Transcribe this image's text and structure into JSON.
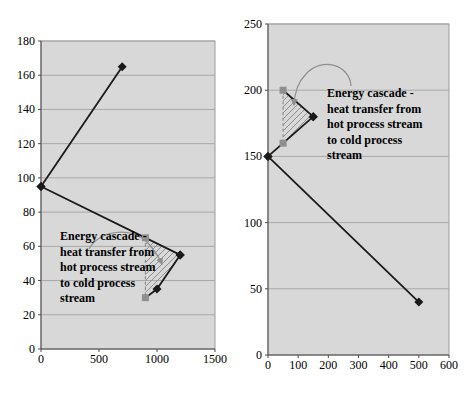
{
  "figure": {
    "background": "#ffffff"
  },
  "colors": {
    "plot_bg": "#d8d8d8",
    "plot_border": "#9c9c9c",
    "gridline": "#a9a9a9",
    "axis": "#4d4d4d",
    "series_black": "#1a1a1a",
    "cascade_gray": "#8f8f8f",
    "text": "#000000"
  },
  "chart_data": [
    {
      "type": "line",
      "title": "",
      "xlabel": "",
      "ylabel": "",
      "xlim": [
        0,
        1500
      ],
      "ylim": [
        0,
        180
      ],
      "x_ticks": [
        0,
        500,
        1000,
        1500
      ],
      "y_ticks": [
        0,
        20,
        40,
        60,
        80,
        100,
        120,
        140,
        160,
        180
      ],
      "grid": "horizontal",
      "legend": "none",
      "series": [
        {
          "name": "cold stream heating curve",
          "marker": "diamond",
          "line": "solid",
          "gray": false,
          "marker_skip": [],
          "points": [
            [
              0,
              95
            ],
            [
              700,
              165
            ]
          ]
        },
        {
          "name": "hot process stream curve",
          "marker": "diamond",
          "line": "solid",
          "gray": false,
          "marker_skip": [],
          "points": [
            [
              0,
              95
            ],
            [
              1200,
              55
            ]
          ]
        },
        {
          "name": "cold process stream curve",
          "marker": "diamond",
          "line": "solid",
          "gray": false,
          "marker_skip": [
            0
          ],
          "points": [
            [
              900,
              30
            ],
            [
              1000,
              35
            ],
            [
              1200,
              55
            ]
          ]
        },
        {
          "name": "energy cascade boundary",
          "marker": "square",
          "line": "dashed",
          "gray": true,
          "marker_skip": [],
          "points": [
            [
              900,
              65
            ],
            [
              900,
              30
            ]
          ]
        }
      ],
      "hatch_region": [
        [
          900,
          65
        ],
        [
          1200,
          55
        ],
        [
          1000,
          35
        ],
        [
          900,
          30
        ]
      ],
      "annotation": {
        "text": "Energy cascade -\nheat transfer from\nhot process stream\nto cold process\nstream"
      }
    },
    {
      "type": "line",
      "title": "",
      "xlabel": "",
      "ylabel": "",
      "xlim": [
        0,
        600
      ],
      "ylim": [
        0,
        250
      ],
      "x_ticks": [
        0,
        100,
        200,
        300,
        400,
        500,
        600
      ],
      "y_ticks": [
        0,
        50,
        100,
        150,
        200,
        250
      ],
      "grid": "horizontal",
      "legend": "none",
      "series": [
        {
          "name": "hot stream upper segment",
          "marker": "diamond",
          "line": "solid",
          "gray": false,
          "marker_skip": [
            0
          ],
          "points": [
            [
              50,
              200
            ],
            [
              150,
              180
            ]
          ]
        },
        {
          "name": "cold stream segment",
          "marker": "diamond",
          "line": "solid",
          "gray": false,
          "marker_skip": [],
          "points": [
            [
              0,
              150
            ],
            [
              150,
              180
            ]
          ]
        },
        {
          "name": "hot process stream curve",
          "marker": "diamond",
          "line": "solid",
          "gray": false,
          "marker_skip": [],
          "points": [
            [
              0,
              150
            ],
            [
              500,
              40
            ]
          ]
        },
        {
          "name": "energy cascade boundary",
          "marker": "square",
          "line": "dashed",
          "gray": true,
          "marker_skip": [],
          "points": [
            [
              50,
              200
            ],
            [
              50,
              160
            ]
          ]
        }
      ],
      "hatch_region": [
        [
          50,
          200
        ],
        [
          150,
          180
        ],
        [
          50,
          160
        ]
      ],
      "annotation": {
        "text": "Energy cascade -\nheat transfer from\nhot process stream\nto cold process\nstream"
      }
    }
  ]
}
